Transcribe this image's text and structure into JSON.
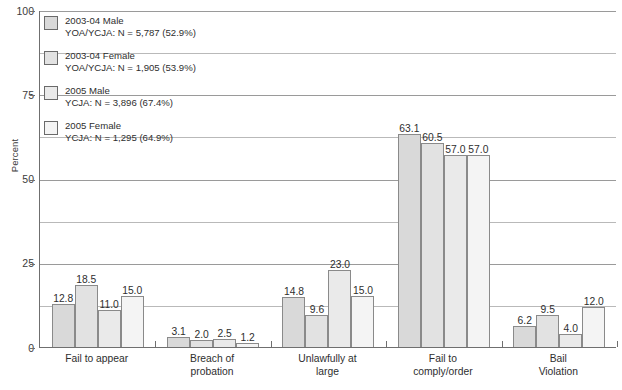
{
  "chart_data": {
    "type": "bar",
    "title": "",
    "subtitle": "",
    "xlabel": "",
    "ylabel": "Percent",
    "ylim": [
      0,
      100
    ],
    "yticks": [
      0,
      25,
      50,
      75,
      100
    ],
    "ytick_labels": [
      "0",
      "25",
      "50",
      "75",
      "100"
    ],
    "minor_gridlines": [
      12.5,
      37.5,
      62.5,
      87.5
    ],
    "grid": true,
    "legend_position": "inside-upper-left",
    "categories": [
      "Fail to appear",
      "Breach of probation",
      "Unlawfully at large",
      "Fail to comply/order",
      "Bail Violation"
    ],
    "category_lines": [
      [
        "Fail to appear",
        ""
      ],
      [
        "Breach of",
        "probation"
      ],
      [
        "Unlawfully at",
        "large"
      ],
      [
        "Fail to",
        "comply/order"
      ],
      [
        "Bail",
        "Violation"
      ]
    ],
    "series": [
      {
        "name": "2003-04 Male",
        "sublabel": "YOA/YCJA: N = 5,787 (52.9%)",
        "color": "#d9d9d9",
        "values": [
          12.8,
          3.1,
          14.8,
          63.1,
          6.2
        ],
        "value_labels": [
          "12.8",
          "3.1",
          "14.8",
          "63.1",
          "6.2"
        ]
      },
      {
        "name": "2003-04 Female",
        "sublabel": "YOA/YCJA: N = 1,905 (53.9%)",
        "color": "#e2e2e2",
        "values": [
          18.5,
          2.0,
          9.6,
          60.5,
          9.5
        ],
        "value_labels": [
          "18.5",
          "2.0",
          "9.6",
          "60.5",
          "9.5"
        ]
      },
      {
        "name": "2005 Male",
        "sublabel": "YCJA: N = 3,896 (67.4%)",
        "color": "#eaeaea",
        "values": [
          11.0,
          2.5,
          23.0,
          57.0,
          4.0
        ],
        "value_labels": [
          "11.0",
          "2.5",
          "23.0",
          "57.0",
          "4.0"
        ]
      },
      {
        "name": "2005 Female",
        "sublabel": "YCJA: N = 1,295 (64.9%)",
        "color": "#f4f4f4",
        "values": [
          15.0,
          1.2,
          15.0,
          57.0,
          12.0
        ],
        "value_labels": [
          "15.0",
          "1.2",
          "15.0",
          "57.0",
          "12.0"
        ]
      }
    ]
  },
  "axis": {
    "y_title": "Percent",
    "y_tick_0": "0",
    "y_tick_25": "25",
    "y_tick_50": "50",
    "y_tick_75": "75",
    "y_tick_100": "100"
  },
  "legend": {
    "items": [
      {
        "label": "2003-04 Male",
        "sublabel": "YOA/YCJA: N = 5,787 (52.9%)"
      },
      {
        "label": "2003-04 Female",
        "sublabel": "YOA/YCJA: N = 1,905 (53.9%)"
      },
      {
        "label": "2005 Male",
        "sublabel": "YCJA: N = 3,896 (67.4%)"
      },
      {
        "label": "2005 Female",
        "sublabel": "YCJA: N = 1,295 (64.9%)"
      }
    ]
  },
  "colors": {
    "series_1": "#d9d9d9",
    "series_2": "#e2e2e2",
    "series_3": "#eaeaea",
    "series_4": "#f4f4f4",
    "bar_outline": "#8a8a8a",
    "axis": "#6f6f6f",
    "gridline": "#b9b9b9",
    "text": "#2e2e2e",
    "background": "#ffffff"
  }
}
